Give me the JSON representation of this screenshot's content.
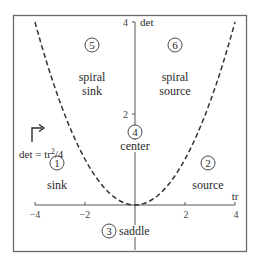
{
  "diagram": {
    "axes": {
      "x_label": "tr",
      "y_label": "det",
      "x_ticks": [
        "−4",
        "−2",
        "2",
        "4"
      ],
      "y_ticks": [
        "2",
        "4"
      ],
      "x_range": [
        -4,
        4
      ],
      "y_range": [
        0,
        4
      ]
    },
    "curve": {
      "equation_label": "det = tr",
      "equation_exp": "2",
      "equation_tail": "/4",
      "style": "dashed"
    },
    "regions": [
      {
        "number": "1",
        "line1": "sink",
        "line2": ""
      },
      {
        "number": "2",
        "line1": "source",
        "line2": ""
      },
      {
        "number": "3",
        "line1": "saddle",
        "line2": ""
      },
      {
        "number": "4",
        "line1": "center",
        "line2": ""
      },
      {
        "number": "5",
        "line1": "spiral",
        "line2": "sink"
      },
      {
        "number": "6",
        "line1": "spiral",
        "line2": "source"
      }
    ],
    "colors": {
      "frame": "#666666",
      "axis": "#555555",
      "curve": "#333333",
      "text": "#2b2b2b"
    }
  }
}
